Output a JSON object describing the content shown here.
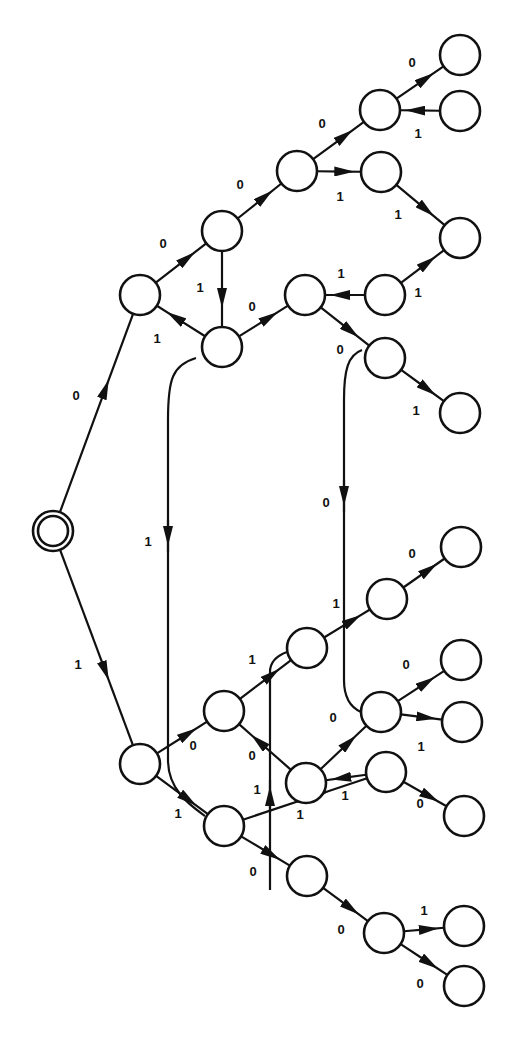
{
  "diagram": {
    "title": "",
    "type": "binary decision tree / state transition diagram",
    "colors": {
      "stroke": "#111111",
      "background": "#ffffff",
      "node_fill": "#ffffff"
    },
    "node_radius": 20,
    "start_node": "S",
    "nodes": [
      {
        "id": "S",
        "x": 53,
        "y": 531,
        "double": true
      },
      {
        "id": "A",
        "x": 140,
        "y": 295
      },
      {
        "id": "B",
        "x": 222,
        "y": 231
      },
      {
        "id": "C",
        "x": 222,
        "y": 347
      },
      {
        "id": "D",
        "x": 297,
        "y": 171
      },
      {
        "id": "E",
        "x": 380,
        "y": 110
      },
      {
        "id": "F",
        "x": 460,
        "y": 55
      },
      {
        "id": "G",
        "x": 460,
        "y": 111
      },
      {
        "id": "H",
        "x": 381,
        "y": 172
      },
      {
        "id": "I",
        "x": 460,
        "y": 238
      },
      {
        "id": "J",
        "x": 305,
        "y": 295
      },
      {
        "id": "K",
        "x": 385,
        "y": 295
      },
      {
        "id": "L",
        "x": 385,
        "y": 358
      },
      {
        "id": "M",
        "x": 460,
        "y": 413
      },
      {
        "id": "N",
        "x": 140,
        "y": 764
      },
      {
        "id": "O",
        "x": 224,
        "y": 711
      },
      {
        "id": "P",
        "x": 307,
        "y": 648
      },
      {
        "id": "Q",
        "x": 387,
        "y": 599
      },
      {
        "id": "R",
        "x": 461,
        "y": 547
      },
      {
        "id": "S2",
        "x": 381,
        "y": 712
      },
      {
        "id": "T",
        "x": 461,
        "y": 660
      },
      {
        "id": "U",
        "x": 462,
        "y": 722
      },
      {
        "id": "V",
        "x": 306,
        "y": 783
      },
      {
        "id": "W",
        "x": 386,
        "y": 772
      },
      {
        "id": "X",
        "x": 464,
        "y": 816
      },
      {
        "id": "Y",
        "x": 224,
        "y": 826
      },
      {
        "id": "Z",
        "x": 307,
        "y": 876
      },
      {
        "id": "AA",
        "x": 384,
        "y": 933
      },
      {
        "id": "AB",
        "x": 464,
        "y": 926
      },
      {
        "id": "AC",
        "x": 464,
        "y": 986
      }
    ],
    "edges": [
      {
        "from": "S",
        "to": "A",
        "label": "0",
        "lx": 76,
        "ly": 397
      },
      {
        "from": "S",
        "to": "N",
        "label": "1",
        "lx": 78,
        "ly": 666
      },
      {
        "from": "A",
        "to": "B",
        "label": "0",
        "lx": 163,
        "ly": 245
      },
      {
        "from": "C",
        "to": "A",
        "label": "1",
        "lx": 157,
        "ly": 340
      },
      {
        "from": "B",
        "to": "D",
        "label": "0",
        "lx": 240,
        "ly": 186
      },
      {
        "from": "B",
        "to": "C",
        "label": "1",
        "lx": 200,
        "ly": 289
      },
      {
        "from": "D",
        "to": "E",
        "label": "0",
        "lx": 322,
        "ly": 125
      },
      {
        "from": "D",
        "to": "H",
        "label": "1",
        "lx": 340,
        "ly": 198
      },
      {
        "from": "E",
        "to": "F",
        "label": "0",
        "lx": 412,
        "ly": 64
      },
      {
        "from": "G",
        "to": "E",
        "label": "1",
        "lx": 418,
        "ly": 135
      },
      {
        "from": "H",
        "to": "I",
        "label": "1",
        "lx": 398,
        "ly": 216
      },
      {
        "from": "K",
        "to": "I",
        "label": "1",
        "lx": 418,
        "ly": 294
      },
      {
        "from": "C",
        "to": "J",
        "label": "0",
        "lx": 252,
        "ly": 308
      },
      {
        "from": "K",
        "to": "J",
        "label": "1",
        "lx": 341,
        "ly": 275
      },
      {
        "from": "J",
        "to": "L",
        "label": "0",
        "lx": 340,
        "ly": 351
      },
      {
        "from": "L",
        "to": "M",
        "label": "1",
        "lx": 416,
        "ly": 412
      },
      {
        "from": "L",
        "to": "S2",
        "label": "0",
        "lx": 326,
        "ly": 504,
        "curve": true
      },
      {
        "from": "C",
        "to": "Y",
        "label": "1",
        "lx": 148,
        "ly": 543,
        "curve": true
      },
      {
        "from": "N",
        "to": "O",
        "label": "0",
        "lx": 193,
        "ly": 747
      },
      {
        "from": "N",
        "to": "Y",
        "label": "1",
        "lx": 178,
        "ly": 815
      },
      {
        "from": "O",
        "to": "P",
        "label": "1",
        "lx": 252,
        "ly": 661
      },
      {
        "from": "V",
        "to": "O",
        "label": "0",
        "lx": 252,
        "ly": 757
      },
      {
        "from": "P",
        "to": "Q",
        "label": "1",
        "lx": 336,
        "ly": 605
      },
      {
        "from": "Q",
        "to": "R",
        "label": "0",
        "lx": 412,
        "ly": 555
      },
      {
        "from": "V",
        "to": "S2",
        "label": "0",
        "lx": 333,
        "ly": 719
      },
      {
        "from": "S2",
        "to": "T",
        "label": "0",
        "lx": 406,
        "ly": 666
      },
      {
        "from": "S2",
        "to": "U",
        "label": "1",
        "lx": 421,
        "ly": 748
      },
      {
        "from": "W",
        "to": "V",
        "label": "1",
        "lx": 345,
        "ly": 797
      },
      {
        "from": "W",
        "to": "X",
        "label": "0",
        "lx": 420,
        "ly": 805
      },
      {
        "from": "Y",
        "to": "W",
        "label": "1",
        "lx": 300,
        "ly": 816
      },
      {
        "from": "Y",
        "to": "P",
        "label": "1",
        "lx": 257,
        "ly": 791,
        "vertical": true
      },
      {
        "from": "Y",
        "to": "Z",
        "label": "0",
        "lx": 253,
        "ly": 873
      },
      {
        "from": "Z",
        "to": "AA",
        "label": "0",
        "lx": 341,
        "ly": 931
      },
      {
        "from": "AA",
        "to": "AB",
        "label": "1",
        "lx": 424,
        "ly": 912
      },
      {
        "from": "AA",
        "to": "AC",
        "label": "0",
        "lx": 420,
        "ly": 985
      }
    ]
  }
}
